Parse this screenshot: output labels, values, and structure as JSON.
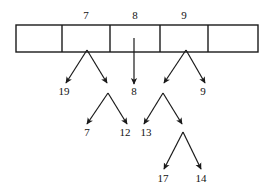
{
  "diagram": {
    "type": "hash-table-with-chained-trees",
    "background_color": "#ffffff",
    "stroke_color": "#1a1a1a",
    "array": {
      "x": 16,
      "y": 25,
      "width": 242,
      "height": 27,
      "dividers_x": [
        62,
        110,
        160,
        208
      ],
      "cells": [
        {
          "id": "cell-0",
          "x": 16,
          "width": 46,
          "label": ""
        },
        {
          "id": "cell-1",
          "x": 62,
          "width": 48,
          "label": "7"
        },
        {
          "id": "cell-2",
          "x": 110,
          "width": 50,
          "label": "8"
        },
        {
          "id": "cell-3",
          "x": 160,
          "width": 48,
          "label": "9"
        },
        {
          "id": "cell-4",
          "x": 208,
          "width": 50,
          "label": ""
        }
      ],
      "index_labels": [
        {
          "text": "7",
          "x": 86,
          "y": 15
        },
        {
          "text": "8",
          "x": 135,
          "y": 15
        },
        {
          "text": "9",
          "x": 184,
          "y": 15
        }
      ]
    },
    "nodes": [
      {
        "id": "node-19",
        "text": "19",
        "x": 64,
        "y": 91
      },
      {
        "id": "node-8",
        "text": "8",
        "x": 134,
        "y": 91
      },
      {
        "id": "node-9",
        "text": "9",
        "x": 203,
        "y": 91
      },
      {
        "id": "node-7",
        "text": "7",
        "x": 87,
        "y": 132
      },
      {
        "id": "node-12",
        "text": "12",
        "x": 125,
        "y": 132
      },
      {
        "id": "node-13",
        "text": "13",
        "x": 146,
        "y": 132
      },
      {
        "id": "node-17",
        "text": "17",
        "x": 163,
        "y": 178
      },
      {
        "id": "node-14",
        "text": "14",
        "x": 201,
        "y": 178
      }
    ],
    "edges": [
      {
        "id": "edge-bucket7-left",
        "from": [
          87,
          50
        ],
        "to": [
          66,
          83
        ]
      },
      {
        "id": "edge-bucket7-right",
        "from": [
          87,
          50
        ],
        "to": [
          107,
          83
        ]
      },
      {
        "id": "edge-bucket8-down",
        "from": [
          134,
          38
        ],
        "to": [
          134,
          84
        ]
      },
      {
        "id": "edge-bucket9-left",
        "from": [
          186,
          50
        ],
        "to": [
          164,
          83
        ]
      },
      {
        "id": "edge-bucket9-right",
        "from": [
          186,
          50
        ],
        "to": [
          205,
          83
        ]
      },
      {
        "id": "edge-n107-left",
        "from": [
          108,
          93
        ],
        "to": [
          87,
          124
        ]
      },
      {
        "id": "edge-n107-right",
        "from": [
          108,
          93
        ],
        "to": [
          127,
          124
        ]
      },
      {
        "id": "edge-n162-left",
        "from": [
          163,
          93
        ],
        "to": [
          144,
          124
        ]
      },
      {
        "id": "edge-n162-right",
        "from": [
          163,
          93
        ],
        "to": [
          182,
          124
        ]
      },
      {
        "id": "edge-n183-left",
        "from": [
          183,
          132
        ],
        "to": [
          164,
          169
        ]
      },
      {
        "id": "edge-n183-right",
        "from": [
          183,
          132
        ],
        "to": [
          201,
          169
        ]
      }
    ]
  }
}
